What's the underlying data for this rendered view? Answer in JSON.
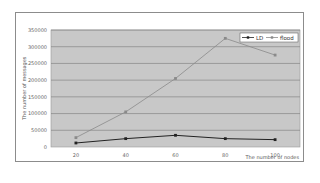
{
  "chart_data": {
    "type": "line",
    "title": "",
    "xlabel": "The number of nodes",
    "ylabel": "The number of messages",
    "categories": [
      20,
      40,
      60,
      80,
      100
    ],
    "x": [
      20,
      40,
      60,
      80,
      100
    ],
    "series": [
      {
        "name": "LD",
        "values": [
          12000,
          25000,
          35000,
          25000,
          22000
        ],
        "color": "#222222",
        "marker": "diamond"
      },
      {
        "name": "flood",
        "values": [
          28000,
          105000,
          205000,
          325000,
          275000
        ],
        "color": "#8a8a8a",
        "marker": "square"
      }
    ],
    "ylim": [
      0,
      350000
    ],
    "yticks": [
      "0",
      "50000",
      "100000",
      "150000",
      "200000",
      "250000",
      "300000",
      "350000"
    ],
    "xticks": [
      "20",
      "40",
      "60",
      "80",
      "100"
    ],
    "grid": true,
    "legend_position": "top-right",
    "plot_background": "#c8c8c8"
  }
}
